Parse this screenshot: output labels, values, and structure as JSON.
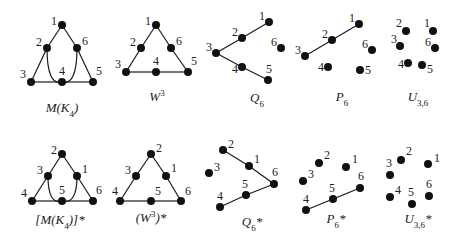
{
  "graphs": [
    {
      "id": "m-k4",
      "name": "M(K4)",
      "label_parts": [
        [
          "M(K",
          ""
        ],
        [
          "4",
          "sub"
        ],
        [
          ")",
          ""
        ]
      ],
      "label_pos": [
        62,
        112
      ],
      "nodes": [
        {
          "id": "1",
          "x": 62,
          "y": 25,
          "lx": -11,
          "ly": 0
        },
        {
          "id": "2",
          "x": 47,
          "y": 48,
          "lx": -11,
          "ly": -2
        },
        {
          "id": "6",
          "x": 77,
          "y": 48,
          "lx": 5,
          "ly": -3
        },
        {
          "id": "3",
          "x": 31,
          "y": 82,
          "lx": -11,
          "ly": -4
        },
        {
          "id": "4",
          "x": 62,
          "y": 82,
          "lx": -3,
          "ly": -7
        },
        {
          "id": "5",
          "x": 93,
          "y": 82,
          "lx": 3,
          "ly": -7
        }
      ],
      "edges": [
        [
          "1",
          "2"
        ],
        [
          "2",
          "3"
        ],
        [
          "1",
          "6"
        ],
        [
          "6",
          "5"
        ],
        [
          "3",
          "4"
        ],
        [
          "4",
          "5"
        ]
      ],
      "curves": [
        [
          "2",
          "4",
          47,
          82
        ],
        [
          "6",
          "4",
          77,
          82
        ]
      ]
    },
    {
      "id": "w3",
      "name": "W3",
      "label_parts": [
        [
          "W",
          ""
        ],
        [
          "3",
          "sup"
        ]
      ],
      "label_pos": [
        157,
        101
      ],
      "nodes": [
        {
          "id": "1",
          "x": 156,
          "y": 25,
          "lx": -11,
          "ly": 0
        },
        {
          "id": "2",
          "x": 141,
          "y": 48,
          "lx": -11,
          "ly": -2
        },
        {
          "id": "6",
          "x": 171,
          "y": 48,
          "lx": 5,
          "ly": -3
        },
        {
          "id": "3",
          "x": 126,
          "y": 72,
          "lx": -11,
          "ly": -4
        },
        {
          "id": "4",
          "x": 156,
          "y": 72,
          "lx": -3,
          "ly": -7
        },
        {
          "id": "5",
          "x": 188,
          "y": 72,
          "lx": 3,
          "ly": -7
        }
      ],
      "edges": [
        [
          "1",
          "2"
        ],
        [
          "2",
          "3"
        ],
        [
          "1",
          "6"
        ],
        [
          "6",
          "5"
        ],
        [
          "3",
          "4"
        ],
        [
          "4",
          "5"
        ]
      ],
      "curves": []
    },
    {
      "id": "q6",
      "name": "Q6",
      "label_parts": [
        [
          "Q",
          ""
        ],
        [
          "6",
          "sub"
        ]
      ],
      "label_pos": [
        257,
        102
      ],
      "nodes": [
        {
          "id": "1",
          "x": 269,
          "y": 22,
          "lx": -10,
          "ly": -2
        },
        {
          "id": "2",
          "x": 242,
          "y": 38,
          "lx": -10,
          "ly": -2
        },
        {
          "id": "3",
          "x": 216,
          "y": 53,
          "lx": -10,
          "ly": -2
        },
        {
          "id": "4",
          "x": 242,
          "y": 67,
          "lx": -10,
          "ly": 6
        },
        {
          "id": "5",
          "x": 268,
          "y": 80,
          "lx": -2,
          "ly": -7
        },
        {
          "id": "6",
          "x": 281,
          "y": 48,
          "lx": -10,
          "ly": -2
        }
      ],
      "edges": [
        [
          "1",
          "2"
        ],
        [
          "2",
          "3"
        ],
        [
          "3",
          "4"
        ],
        [
          "4",
          "5"
        ]
      ],
      "curves": []
    },
    {
      "id": "p6",
      "name": "P6",
      "label_parts": [
        [
          "P",
          ""
        ],
        [
          "6",
          "sub"
        ]
      ],
      "label_pos": [
        342,
        101
      ],
      "nodes": [
        {
          "id": "1",
          "x": 359,
          "y": 24,
          "lx": -10,
          "ly": -2
        },
        {
          "id": "2",
          "x": 332,
          "y": 40,
          "lx": -10,
          "ly": -2
        },
        {
          "id": "3",
          "x": 305,
          "y": 56,
          "lx": -10,
          "ly": -2
        },
        {
          "id": "4",
          "x": 328,
          "y": 67,
          "lx": -10,
          "ly": 4
        },
        {
          "id": "5",
          "x": 360,
          "y": 70,
          "lx": 5,
          "ly": 4
        },
        {
          "id": "6",
          "x": 372,
          "y": 50,
          "lx": -10,
          "ly": -2
        }
      ],
      "edges": [
        [
          "1",
          "2"
        ],
        [
          "2",
          "3"
        ]
      ],
      "curves": []
    },
    {
      "id": "u36",
      "name": "U3,6",
      "label_parts": [
        [
          "U",
          ""
        ],
        [
          "3,6",
          "sub"
        ]
      ],
      "label_pos": [
        418,
        101
      ],
      "nodes": [
        {
          "id": "2",
          "x": 406,
          "y": 31,
          "lx": -10,
          "ly": -4
        },
        {
          "id": "1",
          "x": 433,
          "y": 31,
          "lx": -9,
          "ly": -4
        },
        {
          "id": "3",
          "x": 400,
          "y": 46,
          "lx": -9,
          "ly": -3
        },
        {
          "id": "6",
          "x": 435,
          "y": 48,
          "lx": -10,
          "ly": -2
        },
        {
          "id": "4",
          "x": 408,
          "y": 63,
          "lx": -10,
          "ly": 5
        },
        {
          "id": "5",
          "x": 422,
          "y": 65,
          "lx": 5,
          "ly": 8
        }
      ],
      "edges": [],
      "curves": []
    },
    {
      "id": "m-k4-dual",
      "name": "[M(K4)]*",
      "label_parts": [
        [
          "[M(K",
          ""
        ],
        [
          "4",
          "sub"
        ],
        [
          ")]*",
          ""
        ]
      ],
      "label_pos": [
        60,
        224
      ],
      "nodes": [
        {
          "id": "2",
          "x": 62,
          "y": 154,
          "lx": -11,
          "ly": 0
        },
        {
          "id": "3",
          "x": 48,
          "y": 176,
          "lx": -11,
          "ly": -2
        },
        {
          "id": "1",
          "x": 77,
          "y": 176,
          "lx": 5,
          "ly": -3
        },
        {
          "id": "4",
          "x": 32,
          "y": 201,
          "lx": -11,
          "ly": -4
        },
        {
          "id": "5",
          "x": 62,
          "y": 201,
          "lx": -3,
          "ly": -7
        },
        {
          "id": "6",
          "x": 93,
          "y": 201,
          "lx": 3,
          "ly": -7
        }
      ],
      "edges": [
        [
          "2",
          "3"
        ],
        [
          "3",
          "4"
        ],
        [
          "2",
          "1"
        ],
        [
          "1",
          "6"
        ],
        [
          "4",
          "5"
        ],
        [
          "5",
          "6"
        ]
      ],
      "curves": [
        [
          "3",
          "5",
          48,
          201
        ],
        [
          "1",
          "5",
          77,
          201
        ]
      ]
    },
    {
      "id": "w3-dual",
      "name": "(W3)*",
      "label_parts": [
        [
          "(W",
          ""
        ],
        [
          "3",
          "sup"
        ],
        [
          ")*",
          ""
        ]
      ],
      "label_pos": [
        151,
        222
      ],
      "nodes": [
        {
          "id": "2",
          "x": 151,
          "y": 154,
          "lx": 5,
          "ly": -2
        },
        {
          "id": "3",
          "x": 136,
          "y": 176,
          "lx": -11,
          "ly": -2
        },
        {
          "id": "1",
          "x": 166,
          "y": 176,
          "lx": 5,
          "ly": -4
        },
        {
          "id": "4",
          "x": 120,
          "y": 201,
          "lx": -8,
          "ly": -6
        },
        {
          "id": "5",
          "x": 151,
          "y": 201,
          "lx": 4,
          "ly": -6
        },
        {
          "id": "6",
          "x": 181,
          "y": 201,
          "lx": 4,
          "ly": -6
        }
      ],
      "edges": [
        [
          "2",
          "3"
        ],
        [
          "3",
          "4"
        ],
        [
          "2",
          "1"
        ],
        [
          "1",
          "6"
        ],
        [
          "4",
          "5"
        ],
        [
          "5",
          "6"
        ]
      ],
      "curves": []
    },
    {
      "id": "q6-dual",
      "name": "Q6*",
      "label_parts": [
        [
          "Q",
          ""
        ],
        [
          "6",
          "sub"
        ],
        [
          "*",
          ""
        ]
      ],
      "label_pos": [
        252,
        226
      ],
      "nodes": [
        {
          "id": "2",
          "x": 223,
          "y": 150,
          "lx": 5,
          "ly": -2
        },
        {
          "id": "1",
          "x": 249,
          "y": 166,
          "lx": 5,
          "ly": -3
        },
        {
          "id": "6",
          "x": 274,
          "y": 184,
          "lx": -2,
          "ly": -8
        },
        {
          "id": "3",
          "x": 209,
          "y": 173,
          "lx": 5,
          "ly": -2
        },
        {
          "id": "5",
          "x": 246,
          "y": 195,
          "lx": -4,
          "ly": -7
        },
        {
          "id": "4",
          "x": 220,
          "y": 207,
          "lx": -3,
          "ly": -7
        }
      ],
      "edges": [
        [
          "2",
          "1"
        ],
        [
          "1",
          "6"
        ],
        [
          "6",
          "5"
        ],
        [
          "5",
          "4"
        ]
      ],
      "curves": []
    },
    {
      "id": "p6-dual",
      "name": "P6*",
      "label_parts": [
        [
          "P",
          ""
        ],
        [
          "6",
          "sub"
        ],
        [
          "*",
          ""
        ]
      ],
      "label_pos": [
        336,
        223
      ],
      "nodes": [
        {
          "id": "2",
          "x": 319,
          "y": 163,
          "lx": 5,
          "ly": -4
        },
        {
          "id": "1",
          "x": 346,
          "y": 167,
          "lx": 6,
          "ly": -4
        },
        {
          "id": "3",
          "x": 303,
          "y": 181,
          "lx": 5,
          "ly": -3
        },
        {
          "id": "6",
          "x": 360,
          "y": 188,
          "lx": -2,
          "ly": -8
        },
        {
          "id": "5",
          "x": 333,
          "y": 199,
          "lx": -4,
          "ly": -7
        },
        {
          "id": "4",
          "x": 306,
          "y": 210,
          "lx": -3,
          "ly": -7
        }
      ],
      "edges": [
        [
          "6",
          "5"
        ],
        [
          "5",
          "4"
        ]
      ],
      "curves": []
    },
    {
      "id": "u36-dual",
      "name": "U3,6*",
      "label_parts": [
        [
          "U",
          ""
        ],
        [
          "3,6",
          "sub"
        ],
        [
          "*",
          ""
        ]
      ],
      "label_pos": [
        418,
        223
      ],
      "nodes": [
        {
          "id": "2",
          "x": 401,
          "y": 160,
          "lx": 5,
          "ly": -5
        },
        {
          "id": "1",
          "x": 428,
          "y": 164,
          "lx": 6,
          "ly": -2
        },
        {
          "id": "3",
          "x": 390,
          "y": 175,
          "lx": -4,
          "ly": -8
        },
        {
          "id": "4",
          "x": 390,
          "y": 197,
          "lx": 5,
          "ly": -3
        },
        {
          "id": "5",
          "x": 412,
          "y": 204,
          "lx": -4,
          "ly": -8
        },
        {
          "id": "6",
          "x": 429,
          "y": 196,
          "lx": -3,
          "ly": -8
        }
      ],
      "edges": [],
      "curves": []
    }
  ],
  "style": {
    "node_color": "#111111",
    "edge_color": "#1a1a1a",
    "text_color": "#222222",
    "background": "#ffffff"
  }
}
